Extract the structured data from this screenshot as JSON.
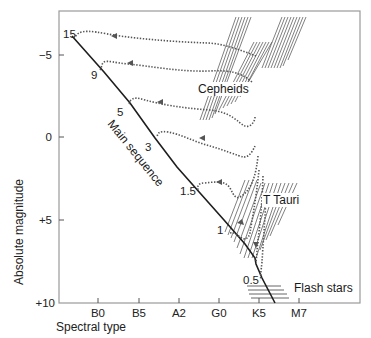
{
  "diagram": {
    "type": "hertzsprung-russell-evolution",
    "y_axis": {
      "label": "Absolute magnitude",
      "ticks": [
        {
          "label": "−5",
          "value": -5,
          "y": 55
        },
        {
          "label": "0",
          "value": 0,
          "y": 137
        },
        {
          "label": "+5",
          "value": 5,
          "y": 220
        },
        {
          "label": "+10",
          "value": 10,
          "y": 303
        }
      ]
    },
    "x_axis": {
      "label": "Spectral type",
      "ticks": [
        {
          "label": "B0",
          "x": 98
        },
        {
          "label": "B5",
          "x": 139
        },
        {
          "label": "A2",
          "x": 179
        },
        {
          "label": "G0",
          "x": 219
        },
        {
          "label": "K5",
          "x": 259
        },
        {
          "label": "M7",
          "x": 299
        }
      ]
    },
    "main_sequence_label": "Main sequence",
    "mass_labels": [
      {
        "text": "15",
        "x": 63,
        "y": 38
      },
      {
        "text": "9",
        "x": 91,
        "y": 79
      },
      {
        "text": "5",
        "x": 117,
        "y": 116
      },
      {
        "text": "3",
        "x": 145,
        "y": 151
      },
      {
        "text": "1.5",
        "x": 180,
        "y": 195
      },
      {
        "text": "1",
        "x": 214,
        "y": 234
      },
      {
        "text": "0.5",
        "x": 243,
        "y": 284
      }
    ],
    "regions": [
      {
        "name": "Cepheids",
        "x": 198,
        "y": 93
      },
      {
        "name": "T Tauri",
        "x": 263,
        "y": 204
      },
      {
        "name": "Flash stars",
        "x": 294,
        "y": 292
      }
    ],
    "colors": {
      "frame": "#9a9a9a",
      "main_sequence": "#1e1e1e",
      "tracks": "#555555",
      "text": "#222222"
    }
  }
}
